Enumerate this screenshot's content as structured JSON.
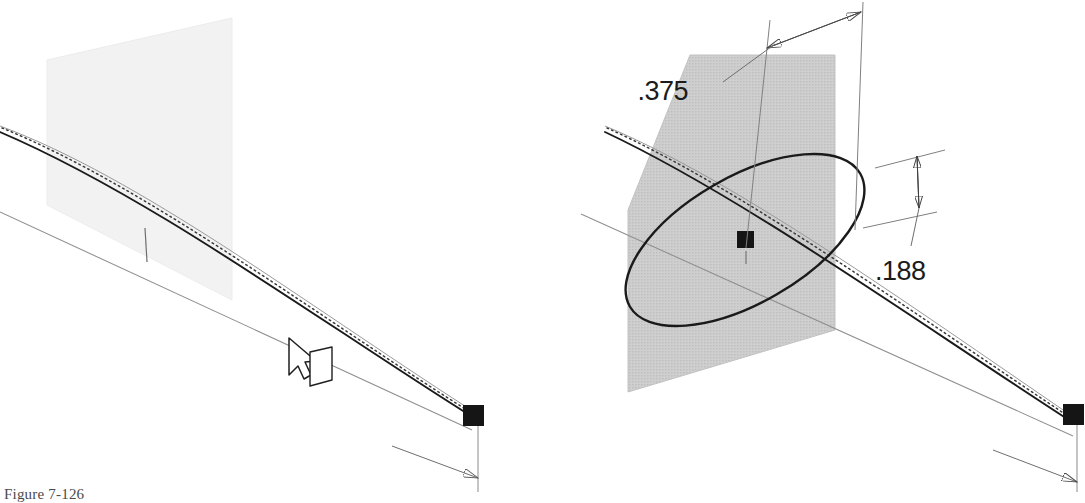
{
  "figure": {
    "caption": "Figure 7-126",
    "caption_visible_portion": "Figure 7-126",
    "domain_note": "CAD modeling tutorial illustration — two isometric viewports of a swept curve through a sketch plane"
  },
  "colors": {
    "plane_fill_left": "#f2f2f2",
    "plane_fill_right": "#c9c9c9",
    "plane_edge": "#d9d9d9",
    "curve_dark": "#1a1a1a",
    "line_gray": "#8c8c8c",
    "line_light_gray": "#a8a8a8",
    "dotted": "#3a3a3a",
    "endpoint_black": "#151515",
    "dim_text": "#1b1b1b",
    "caption_text": "#4a4a4a",
    "background": "#ffffff"
  },
  "left_view": {
    "name": "left-viewport",
    "description": "Sketch plane being selected with the plane cursor, no circle drawn yet",
    "plane": {
      "label": "sketch-plane",
      "fill": "#f2f2f2",
      "opacity": 0.9
    },
    "cursor": {
      "label": "plane-select-cursor",
      "type": "arrow-with-plane-glyph"
    },
    "endpoint": {
      "label": "curve-endpoint",
      "marker": "black-square"
    },
    "tick": {
      "label": "midpoint-tick"
    },
    "curves": [
      "swept-spline",
      "dotted-reference-path",
      "upper-guide-line",
      "lower-guide-line"
    ]
  },
  "right_view": {
    "name": "right-viewport",
    "description": "Circle profile sketched on the plane with two driving dimensions",
    "plane": {
      "label": "sketch-plane",
      "fill": "#c9c9c9",
      "opacity": 0.95
    },
    "circle": {
      "label": "circle-profile",
      "rendered_as": "ellipse-in-isometric"
    },
    "center_point": {
      "label": "circle-center-point",
      "marker": "black-square"
    },
    "endpoint": {
      "label": "curve-endpoint",
      "marker": "black-square"
    },
    "curves": [
      "swept-spline",
      "dotted-reference-path",
      "upper-guide-line",
      "lower-guide-line"
    ],
    "dimensions": [
      {
        "id": "dim-horizontal",
        "value": ".375",
        "orientation": "horizontal-offset",
        "arrowheads": "both-ends",
        "leader": true
      },
      {
        "id": "dim-vertical",
        "value": ".188",
        "orientation": "vertical-offset",
        "arrowheads": "both-ends",
        "leader": true
      }
    ]
  }
}
